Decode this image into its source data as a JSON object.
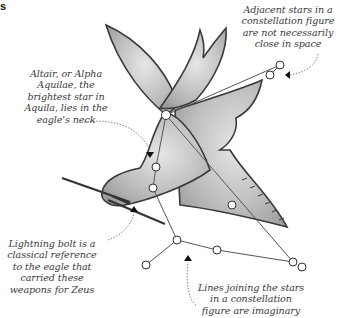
{
  "corner_fragment": "s",
  "figure": {
    "colors": {
      "eagle_fill": "#b9b9b9",
      "eagle_outline": "#3a3a3a",
      "star_fill": "#ffffff",
      "star_outline": "#333333",
      "line": "#555555",
      "text": "#3a3a3a"
    }
  },
  "annotations": {
    "altair": "Altair, or Alpha Aquilae, the brightest star in Aquila, lies in the eagle's neck",
    "altair_lines": [
      "Altair, or Alpha",
      "Aquilae, the",
      "brightest star in",
      "Aquila, lies in the",
      "eagle's neck"
    ],
    "adjacent_lines": [
      "Adjacent stars in a",
      "constellation figure",
      "are not necessarily",
      "close in space"
    ],
    "lightning_lines": [
      "Lightning bolt is a",
      "classical reference",
      "to the eagle that",
      "carried these",
      "weapons for Zeus"
    ],
    "lines_joining_lines": [
      "Lines joining the stars",
      "in a constellation",
      "figure are imaginary"
    ]
  }
}
